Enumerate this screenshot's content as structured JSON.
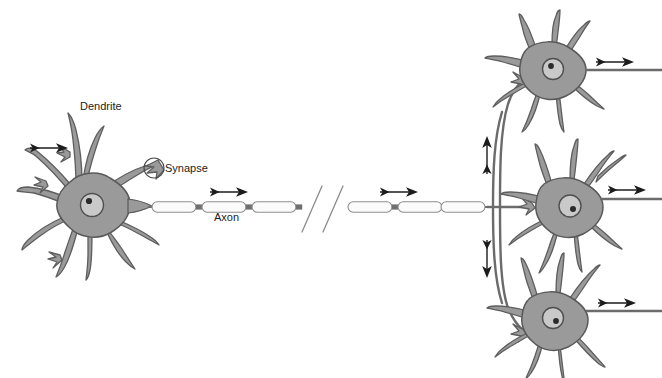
{
  "figure": {
    "kind": "biology-illustration",
    "background_color": "#ffffff"
  },
  "palette": {
    "soma_fill": "#9a9a9a",
    "soma_stroke": "#595959",
    "dendrite_fill": "#9a9a9a",
    "dendrite_stroke": "#5e5e5e",
    "nucleus_fill": "#c9c9c9",
    "nucleus_stroke": "#4f4f4f",
    "nucleolus_fill": "#2b2b2b",
    "myelin_fill": "#fbfbfb",
    "myelin_stroke": "#8e8e8e",
    "node_fill": "#6f6f6f",
    "axon_line": "#6b6b6b",
    "arrow_color": "#1c1c1c",
    "break_mark": "#8b8b8b",
    "text_color": "#1c1c1c"
  },
  "labels": {
    "dendrite": "Dendrite",
    "synapse": "Synapse",
    "axon": "Axon"
  },
  "label_positions": [
    {
      "name": "dendrite",
      "text": "Dendrite",
      "x": 80,
      "y": 110
    },
    {
      "name": "synapse",
      "text": "Synapse",
      "x": 158,
      "y": 167
    },
    {
      "name": "axon",
      "text": "Axon",
      "x": 214,
      "y": 221
    }
  ],
  "neurons": [
    {
      "name": "presynaptic-neuron",
      "role": "sending",
      "position": "left",
      "soma_center": {
        "x": 88,
        "y": 205
      },
      "nucleus_center": {
        "x": 92,
        "y": 205
      }
    },
    {
      "name": "postsynaptic-neuron-top",
      "role": "receiving",
      "position": "top-right",
      "soma_center": {
        "x": 549,
        "y": 68
      },
      "nucleus_center": {
        "x": 553,
        "y": 69
      }
    },
    {
      "name": "postsynaptic-neuron-middle",
      "role": "receiving",
      "position": "middle-right",
      "soma_center": {
        "x": 566,
        "y": 205
      },
      "nucleus_center": {
        "x": 570,
        "y": 206
      }
    },
    {
      "name": "postsynaptic-neuron-bottom",
      "role": "receiving",
      "position": "bottom-right",
      "soma_center": {
        "x": 551,
        "y": 318
      },
      "nucleus_center": {
        "x": 553,
        "y": 318
      }
    }
  ],
  "axon": {
    "name": "myelinated-axon",
    "has_break_marks": true,
    "break_mark_count": 2,
    "myelin_segments": 6,
    "nodes_of_ranvier": 5,
    "start_x": 150,
    "end_x": 487,
    "y": 207
  },
  "signal_arrows": [
    {
      "name": "input-arrow-left-dendrite",
      "direction": "right",
      "x": 30,
      "y": 148,
      "length": 40
    },
    {
      "name": "axon-arrow-proximal",
      "direction": "right",
      "x": 210,
      "y": 192,
      "length": 42
    },
    {
      "name": "axon-arrow-distal",
      "direction": "right",
      "x": 380,
      "y": 192,
      "length": 42
    },
    {
      "name": "branch-arrow-up",
      "direction": "up",
      "x": 487,
      "y": 155,
      "length": 38
    },
    {
      "name": "branch-arrow-down",
      "direction": "down",
      "x": 487,
      "y": 255,
      "length": 38
    },
    {
      "name": "output-arrow-top-neuron",
      "direction": "right",
      "x": 596,
      "y": 62,
      "length": 42
    },
    {
      "name": "output-arrow-middle-neuron",
      "direction": "right",
      "x": 608,
      "y": 190,
      "length": 42
    },
    {
      "name": "output-arrow-bottom-neuron",
      "direction": "right",
      "x": 598,
      "y": 303,
      "length": 42
    }
  ],
  "synapse_marker": {
    "name": "synapse-circle",
    "center": {
      "x": 154,
      "y": 168
    },
    "radius": 10
  }
}
